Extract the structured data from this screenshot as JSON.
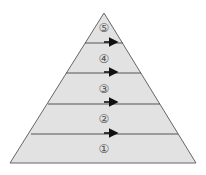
{
  "diagram": {
    "type": "pyramid",
    "levels": [
      {
        "label": "⑤",
        "y_center": 28
      },
      {
        "label": "④",
        "y_center": 58
      },
      {
        "label": "③",
        "y_center": 88
      },
      {
        "label": "②",
        "y_center": 119
      },
      {
        "label": "①",
        "y_center": 149
      }
    ],
    "arrow_count": 4,
    "colors": {
      "fill": "#e2e2e2",
      "stroke": "#555555",
      "arrow": "#111111"
    }
  }
}
